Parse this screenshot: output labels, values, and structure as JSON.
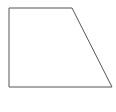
{
  "diagram": {
    "shape": "trapezoid",
    "stroke_color": "#555555",
    "fill_color": "#ffffff",
    "background": "#ffffff",
    "vertices": [
      [
        9,
        8
      ],
      [
        72,
        8
      ],
      [
        112,
        87
      ],
      [
        9,
        87
      ]
    ]
  }
}
